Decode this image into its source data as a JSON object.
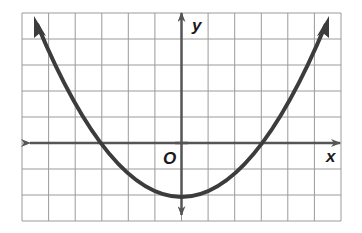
{
  "graph": {
    "function": "y = (2/9)x^2 - 2",
    "x_label": "x",
    "y_label": "y",
    "origin_label": "O",
    "grid": {
      "cols": 12,
      "rows": 8,
      "x_range": [
        -6,
        6
      ],
      "y_range": [
        -3,
        5
      ]
    },
    "features": {
      "vertex": [
        0,
        -2
      ],
      "x_intercepts": [
        -3,
        3
      ],
      "opens": "up"
    },
    "colors": {
      "curve": "#3c3c3c",
      "axis": "#555555",
      "grid": "#9a9a9a"
    }
  }
}
